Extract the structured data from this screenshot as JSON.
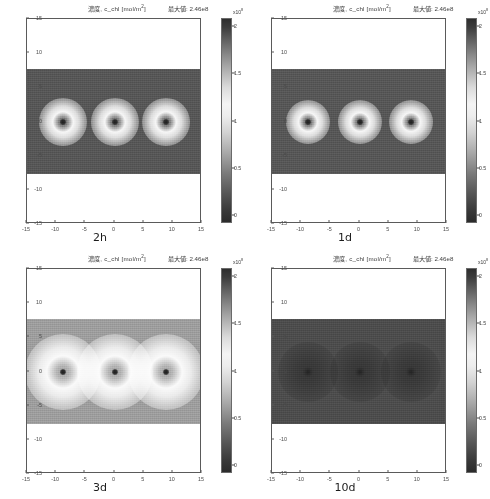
{
  "figure": {
    "panel_title": "濃度, c_chl [mol/m",
    "panel_title_sup": "2",
    "panel_title_tail": "]",
    "colorbar_exponent_label": "x10",
    "colorbar_exponent_sup": "8"
  },
  "axes": {
    "x_ticks": [
      "-15",
      "-10",
      "-5",
      "0",
      "5",
      "10",
      "15"
    ],
    "y_ticks": [
      "15",
      "10",
      "5",
      "0",
      "-5",
      "-10",
      "-15"
    ],
    "colorbar_ticks": [
      "2",
      "1.5",
      "1",
      "0.5",
      "0"
    ]
  },
  "panels": [
    {
      "caption": "2h",
      "max_label": "最大値: 2.46e8",
      "background_level": 0.34,
      "spot_radius_px": 24,
      "spot_peak": 1.0,
      "core_radius_px": 3
    },
    {
      "caption": "1d",
      "max_label": "最大値: 2.46e8",
      "background_level": 0.34,
      "spot_radius_px": 22,
      "spot_peak": 1.0,
      "core_radius_px": 3
    },
    {
      "caption": "3d",
      "max_label": "最大値: 2.46e8",
      "background_level": 0.62,
      "spot_radius_px": 38,
      "spot_peak": 1.0,
      "core_radius_px": 3
    },
    {
      "caption": "10d",
      "max_label": "最大値: 2.46e8",
      "background_level": 0.3,
      "spot_radius_px": 30,
      "spot_peak": 0.16,
      "core_radius_px": 5
    }
  ],
  "chart_data": {
    "type": "heatmap",
    "xlabel": "",
    "ylabel": "",
    "xlim": [
      -17,
      17
    ],
    "ylim": [
      -17,
      17
    ],
    "data_extent_x": [
      -14,
      14
    ],
    "data_extent_y": [
      -7.5,
      7.5
    ],
    "grid": false,
    "legend": "colorbar-right",
    "colormap": "grayscale",
    "colorbar": {
      "ticks": [
        0,
        0.5,
        1,
        1.5,
        2
      ],
      "range": [
        0,
        2.46
      ],
      "multiplier": "x10^8",
      "units": "mol/m^2"
    },
    "source_positions_x": [
      -10,
      0,
      10
    ],
    "source_positions_y": [
      0,
      0,
      0
    ],
    "panels": [
      {
        "label": "2h",
        "max_value": 246000000.0,
        "max_value_text": "2.46e8",
        "background_value": 84000000.0,
        "peak_radius": 2.0,
        "description": "three tight bright halos with dark cores on mid-gray field"
      },
      {
        "label": "1d",
        "max_value": 246000000.0,
        "max_value_text": "2.46e8",
        "background_value": 84000000.0,
        "peak_radius": 1.8,
        "description": "three tight bright halos with dark cores on mid-gray field"
      },
      {
        "label": "3d",
        "max_value": 246000000.0,
        "max_value_text": "2.46e8",
        "background_value": 152000000.0,
        "peak_radius": 3.1,
        "description": "three broad diffuse bright rings on light field"
      },
      {
        "label": "10d",
        "max_value": 246000000.0,
        "max_value_text": "2.46e8",
        "background_value": 74000000.0,
        "peak_radius": 2.5,
        "description": "nearly uniform dark field with three faint dark blobs"
      }
    ]
  }
}
